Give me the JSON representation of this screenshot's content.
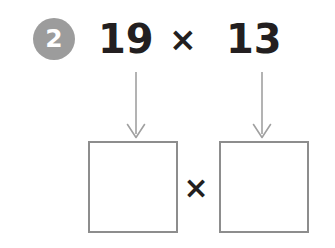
{
  "page": {
    "background_color": "#ffffff",
    "width": 335,
    "height": 248
  },
  "question": {
    "number": "2",
    "badge_color": "#9c9c9c",
    "badge_text_color": "#ffffff"
  },
  "equation": {
    "left_operand": "19",
    "operator": "×",
    "right_operand": "13",
    "text_color": "#231f20"
  },
  "arrows": [
    {
      "name": "arrow-to-left-box",
      "direction": "down",
      "color": "#a0a0a0"
    },
    {
      "name": "arrow-to-right-box",
      "direction": "down",
      "color": "#a0a0a0"
    }
  ],
  "answer_row": {
    "left_box": {
      "value": "",
      "border_color": "#8d8d8d"
    },
    "operator": "×",
    "right_box": {
      "value": "",
      "border_color": "#8d8d8d"
    }
  },
  "icons": {
    "arrow_down_icon": "arrow-down-icon",
    "multiply_icon": "multiply-icon"
  }
}
